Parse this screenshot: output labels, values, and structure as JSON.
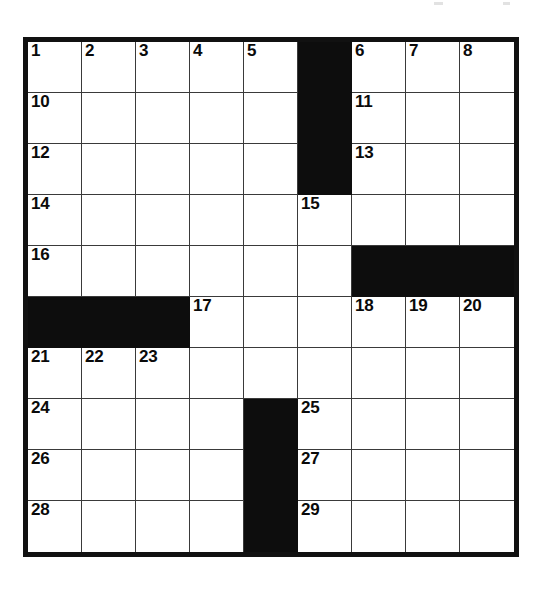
{
  "document": {
    "type": "crossword-puzzle-grid",
    "title": "",
    "rows": 10,
    "columns": 9,
    "colors": {
      "page_background": "#ffffff",
      "cell_background": "#ffffff",
      "block_color": "#0d0d0d",
      "grid_line_color": "#3a3a3a",
      "outer_border_color": "#111111",
      "number_color": "#0a0a0a"
    }
  },
  "grid": {
    "block_cells": [
      [
        0,
        5
      ],
      [
        1,
        5
      ],
      [
        2,
        5
      ],
      [
        4,
        6
      ],
      [
        4,
        7
      ],
      [
        4,
        8
      ],
      [
        5,
        0
      ],
      [
        5,
        1
      ],
      [
        5,
        2
      ],
      [
        7,
        4
      ],
      [
        8,
        4
      ],
      [
        9,
        4
      ]
    ],
    "numbers": [
      {
        "row": 0,
        "col": 0,
        "label": "1"
      },
      {
        "row": 0,
        "col": 1,
        "label": "2"
      },
      {
        "row": 0,
        "col": 2,
        "label": "3"
      },
      {
        "row": 0,
        "col": 3,
        "label": "4"
      },
      {
        "row": 0,
        "col": 4,
        "label": "5"
      },
      {
        "row": 0,
        "col": 6,
        "label": "6"
      },
      {
        "row": 0,
        "col": 7,
        "label": "7"
      },
      {
        "row": 0,
        "col": 8,
        "label": "8"
      },
      {
        "row": 0,
        "col": 9,
        "label": "9"
      },
      {
        "row": 1,
        "col": 0,
        "label": "10"
      },
      {
        "row": 1,
        "col": 6,
        "label": "11"
      },
      {
        "row": 2,
        "col": 0,
        "label": "12"
      },
      {
        "row": 2,
        "col": 6,
        "label": "13"
      },
      {
        "row": 3,
        "col": 0,
        "label": "14"
      },
      {
        "row": 3,
        "col": 5,
        "label": "15"
      },
      {
        "row": 4,
        "col": 0,
        "label": "16"
      },
      {
        "row": 5,
        "col": 3,
        "label": "17"
      },
      {
        "row": 5,
        "col": 6,
        "label": "18"
      },
      {
        "row": 5,
        "col": 7,
        "label": "19"
      },
      {
        "row": 5,
        "col": 8,
        "label": "20"
      },
      {
        "row": 6,
        "col": 0,
        "label": "21"
      },
      {
        "row": 6,
        "col": 1,
        "label": "22"
      },
      {
        "row": 6,
        "col": 2,
        "label": "23"
      },
      {
        "row": 7,
        "col": 0,
        "label": "24"
      },
      {
        "row": 7,
        "col": 5,
        "label": "25"
      },
      {
        "row": 8,
        "col": 0,
        "label": "26"
      },
      {
        "row": 8,
        "col": 5,
        "label": "27"
      },
      {
        "row": 9,
        "col": 0,
        "label": "28"
      },
      {
        "row": 9,
        "col": 5,
        "label": "29"
      }
    ],
    "cells": [
      [
        {
          "number": "1",
          "block": false,
          "letter": ""
        },
        {
          "number": "2",
          "block": false,
          "letter": ""
        },
        {
          "number": "3",
          "block": false,
          "letter": ""
        },
        {
          "number": "4",
          "block": false,
          "letter": ""
        },
        {
          "number": "5",
          "block": false,
          "letter": ""
        },
        {
          "number": "",
          "block": true,
          "letter": ""
        },
        {
          "number": "6",
          "block": false,
          "letter": ""
        },
        {
          "number": "7",
          "block": false,
          "letter": ""
        },
        {
          "number": "8",
          "block": false,
          "letter": ""
        }
      ],
      [
        {
          "number": "10",
          "block": false,
          "letter": ""
        },
        {
          "number": "",
          "block": false,
          "letter": ""
        },
        {
          "number": "",
          "block": false,
          "letter": ""
        },
        {
          "number": "",
          "block": false,
          "letter": ""
        },
        {
          "number": "",
          "block": false,
          "letter": ""
        },
        {
          "number": "",
          "block": true,
          "letter": ""
        },
        {
          "number": "11",
          "block": false,
          "letter": ""
        },
        {
          "number": "",
          "block": false,
          "letter": ""
        },
        {
          "number": "",
          "block": false,
          "letter": ""
        }
      ],
      [
        {
          "number": "12",
          "block": false,
          "letter": ""
        },
        {
          "number": "",
          "block": false,
          "letter": ""
        },
        {
          "number": "",
          "block": false,
          "letter": ""
        },
        {
          "number": "",
          "block": false,
          "letter": ""
        },
        {
          "number": "",
          "block": false,
          "letter": ""
        },
        {
          "number": "",
          "block": true,
          "letter": ""
        },
        {
          "number": "13",
          "block": false,
          "letter": ""
        },
        {
          "number": "",
          "block": false,
          "letter": ""
        },
        {
          "number": "",
          "block": false,
          "letter": ""
        }
      ],
      [
        {
          "number": "14",
          "block": false,
          "letter": ""
        },
        {
          "number": "",
          "block": false,
          "letter": ""
        },
        {
          "number": "",
          "block": false,
          "letter": ""
        },
        {
          "number": "",
          "block": false,
          "letter": ""
        },
        {
          "number": "",
          "block": false,
          "letter": ""
        },
        {
          "number": "15",
          "block": false,
          "letter": ""
        },
        {
          "number": "",
          "block": false,
          "letter": ""
        },
        {
          "number": "",
          "block": false,
          "letter": ""
        },
        {
          "number": "",
          "block": false,
          "letter": ""
        }
      ],
      [
        {
          "number": "16",
          "block": false,
          "letter": ""
        },
        {
          "number": "",
          "block": false,
          "letter": ""
        },
        {
          "number": "",
          "block": false,
          "letter": ""
        },
        {
          "number": "",
          "block": false,
          "letter": ""
        },
        {
          "number": "",
          "block": false,
          "letter": ""
        },
        {
          "number": "",
          "block": false,
          "letter": ""
        },
        {
          "number": "",
          "block": true,
          "letter": ""
        },
        {
          "number": "",
          "block": true,
          "letter": ""
        },
        {
          "number": "",
          "block": true,
          "letter": ""
        }
      ],
      [
        {
          "number": "",
          "block": true,
          "letter": ""
        },
        {
          "number": "",
          "block": true,
          "letter": ""
        },
        {
          "number": "",
          "block": true,
          "letter": ""
        },
        {
          "number": "17",
          "block": false,
          "letter": ""
        },
        {
          "number": "",
          "block": false,
          "letter": ""
        },
        {
          "number": "",
          "block": false,
          "letter": ""
        },
        {
          "number": "18",
          "block": false,
          "letter": ""
        },
        {
          "number": "19",
          "block": false,
          "letter": ""
        },
        {
          "number": "20",
          "block": false,
          "letter": ""
        }
      ],
      [
        {
          "number": "21",
          "block": false,
          "letter": ""
        },
        {
          "number": "22",
          "block": false,
          "letter": ""
        },
        {
          "number": "23",
          "block": false,
          "letter": ""
        },
        {
          "number": "",
          "block": false,
          "letter": ""
        },
        {
          "number": "",
          "block": false,
          "letter": ""
        },
        {
          "number": "",
          "block": false,
          "letter": ""
        },
        {
          "number": "",
          "block": false,
          "letter": ""
        },
        {
          "number": "",
          "block": false,
          "letter": ""
        },
        {
          "number": "",
          "block": false,
          "letter": ""
        }
      ],
      [
        {
          "number": "24",
          "block": false,
          "letter": ""
        },
        {
          "number": "",
          "block": false,
          "letter": ""
        },
        {
          "number": "",
          "block": false,
          "letter": ""
        },
        {
          "number": "",
          "block": false,
          "letter": ""
        },
        {
          "number": "",
          "block": true,
          "letter": ""
        },
        {
          "number": "25",
          "block": false,
          "letter": ""
        },
        {
          "number": "",
          "block": false,
          "letter": ""
        },
        {
          "number": "",
          "block": false,
          "letter": ""
        },
        {
          "number": "",
          "block": false,
          "letter": ""
        }
      ],
      [
        {
          "number": "26",
          "block": false,
          "letter": ""
        },
        {
          "number": "",
          "block": false,
          "letter": ""
        },
        {
          "number": "",
          "block": false,
          "letter": ""
        },
        {
          "number": "",
          "block": false,
          "letter": ""
        },
        {
          "number": "",
          "block": true,
          "letter": ""
        },
        {
          "number": "27",
          "block": false,
          "letter": ""
        },
        {
          "number": "",
          "block": false,
          "letter": ""
        },
        {
          "number": "",
          "block": false,
          "letter": ""
        },
        {
          "number": "",
          "block": false,
          "letter": ""
        }
      ],
      [
        {
          "number": "28",
          "block": false,
          "letter": ""
        },
        {
          "number": "",
          "block": false,
          "letter": ""
        },
        {
          "number": "",
          "block": false,
          "letter": ""
        },
        {
          "number": "",
          "block": false,
          "letter": ""
        },
        {
          "number": "",
          "block": true,
          "letter": ""
        },
        {
          "number": "29",
          "block": false,
          "letter": ""
        },
        {
          "number": "",
          "block": false,
          "letter": ""
        },
        {
          "number": "",
          "block": false,
          "letter": ""
        },
        {
          "number": "",
          "block": false,
          "letter": ""
        }
      ]
    ]
  }
}
